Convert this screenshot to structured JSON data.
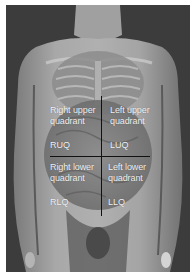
{
  "figure": {
    "colors": {
      "background": "#3e3e3e",
      "skin": "#9a9a9a",
      "label_text": "#f2f2f2",
      "divider_line": "#111111",
      "border": "#ffffff"
    },
    "quadrants": {
      "right_upper": {
        "line1": "Right upper",
        "line2": "quadrant",
        "abbr": "RUQ"
      },
      "left_upper": {
        "line1": "Left upper",
        "line2": "quadrant",
        "abbr": "LUQ"
      },
      "right_lower": {
        "line1": "Right lower",
        "line2": "quadrant",
        "abbr": "RLQ"
      },
      "left_lower": {
        "line1": "Left lower",
        "line2": "quadrant",
        "abbr": "LLQ"
      }
    }
  }
}
